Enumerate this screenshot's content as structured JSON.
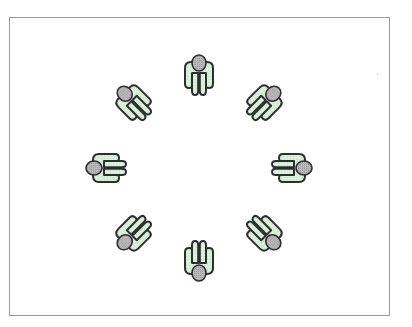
{
  "diagram": {
    "title": "",
    "figure_style": {
      "body_fill": "#d9f1dc",
      "outline": "#2e2e2e",
      "head_fill": "#b5b5b5",
      "frame_color": "#9a9a9a"
    },
    "people": [
      {
        "id": "person-top",
        "angle_deg": 0
      },
      {
        "id": "person-top-right",
        "angle_deg": 45
      },
      {
        "id": "person-right",
        "angle_deg": 90
      },
      {
        "id": "person-bottom-right",
        "angle_deg": 135
      },
      {
        "id": "person-bottom",
        "angle_deg": 180
      },
      {
        "id": "person-bottom-left",
        "angle_deg": 225
      },
      {
        "id": "person-left",
        "angle_deg": 270
      },
      {
        "id": "person-top-left",
        "angle_deg": 315
      }
    ]
  }
}
